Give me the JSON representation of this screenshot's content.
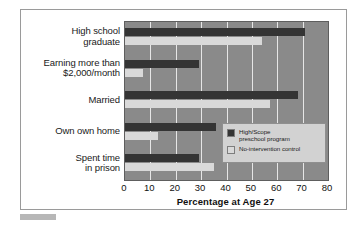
{
  "chart_data": {
    "type": "bar",
    "orientation": "horizontal",
    "title": "",
    "xlabel": "Percentage at Age 27",
    "ylabel": "",
    "xlim": [
      0,
      80
    ],
    "xticks": [
      0,
      10,
      20,
      30,
      40,
      50,
      60,
      70,
      80
    ],
    "grid": true,
    "legend_position": "inside-bottom-right",
    "categories": [
      "High school\ngraduate",
      "Earning more than\n$2,000/month",
      "Married",
      "Own own home",
      "Spent time\nin prison"
    ],
    "series": [
      {
        "name": "High/Scope\npreschool program",
        "color": "#343434",
        "values": [
          71,
          29,
          68,
          36,
          29
        ]
      },
      {
        "name": "No-intervention control",
        "color": "#d9d9d9",
        "values": [
          54,
          7,
          57,
          13,
          35
        ]
      }
    ]
  },
  "axis": {
    "xlabel": "Percentage at Age 27",
    "tick_labels": [
      "0",
      "10",
      "20",
      "30",
      "40",
      "50",
      "60",
      "70",
      "80"
    ]
  },
  "legend": {
    "entries": [
      {
        "label": "High/Scope\npreschool program",
        "swatch": "#343434"
      },
      {
        "label": "No-intervention control",
        "swatch": "#d9d9d9"
      }
    ]
  },
  "colors": {
    "plot_background": "#8a8a8a",
    "gridline": "#e6e6e6",
    "figure_background": "#ffffff",
    "frame_border": "#9a9a9a",
    "legend_background": "#d2d2d2",
    "series_1": "#343434",
    "series_2": "#d9d9d9"
  }
}
